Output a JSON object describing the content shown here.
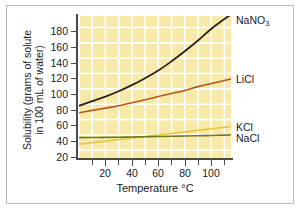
{
  "chart_data": {
    "type": "line",
    "title": "",
    "xlabel": "Temperature °C",
    "ylabel_line1": "Solubility (grams of solute",
    "ylabel_line2": "in 100 mL of water)",
    "xlim": [
      0,
      115
    ],
    "ylim": [
      10,
      195
    ],
    "xticks": [
      20,
      40,
      60,
      80,
      100
    ],
    "xminor_step": 10,
    "yticks": [
      20,
      40,
      60,
      80,
      100,
      120,
      140,
      160,
      180
    ],
    "grid": true,
    "grid_color": "#ffffff",
    "plot_background": "#f7e9a8",
    "legend_position": "right-of-curve-ends",
    "series": [
      {
        "name": "NaNO3",
        "label": "NaNO",
        "label_sub": "3",
        "color": "#2b2118",
        "x": [
          0,
          10,
          20,
          30,
          40,
          50,
          60,
          70,
          80,
          90,
          100,
          110,
          115
        ],
        "values": [
          78,
          84,
          90,
          97,
          105,
          114,
          124,
          136,
          149,
          163,
          178,
          191,
          197
        ]
      },
      {
        "name": "LiCl",
        "label": "LiCl",
        "label_sub": "",
        "color": "#b9561c",
        "x": [
          0,
          10,
          20,
          30,
          40,
          50,
          60,
          70,
          80,
          90,
          100,
          110,
          115
        ],
        "values": [
          69,
          72,
          75,
          78,
          82,
          86,
          90,
          94,
          98,
          103,
          107,
          111,
          113
        ]
      },
      {
        "name": "KCl",
        "label": "KCl",
        "label_sub": "",
        "color": "#e8c547",
        "x": [
          0,
          10,
          20,
          30,
          40,
          50,
          60,
          70,
          80,
          90,
          100,
          110,
          115
        ],
        "values": [
          28,
          30,
          32,
          34,
          36,
          38,
          40,
          42,
          44,
          46,
          48,
          50,
          51
        ]
      },
      {
        "name": "NaCl",
        "label": "NaCl",
        "label_sub": "",
        "color": "#6e7a1e",
        "x": [
          0,
          10,
          20,
          30,
          40,
          50,
          60,
          70,
          80,
          90,
          100,
          110,
          115
        ],
        "values": [
          36.5,
          36.7,
          36.9,
          37.1,
          37.4,
          37.7,
          38.0,
          38.3,
          38.6,
          39.0,
          39.4,
          39.8,
          40.0
        ]
      }
    ]
  },
  "labels": {
    "nano3": "NaNO",
    "nano3_sub": "3",
    "licl": "LiCl",
    "kcl": "KCl",
    "nacl": "NaCl"
  },
  "axis": {
    "x_title": "Temperature °C",
    "y_title_line1": "Solubility (grams of solute",
    "y_title_line2": "in 100 mL of water)",
    "y_ticks": {
      "t20": "20",
      "t40": "40",
      "t60": "60",
      "t80": "80",
      "t100": "100",
      "t120": "120",
      "t140": "140",
      "t160": "160",
      "t180": "180"
    },
    "x_ticks": {
      "t20": "20",
      "t40": "40",
      "t60": "60",
      "t80": "80",
      "t100": "100"
    }
  }
}
